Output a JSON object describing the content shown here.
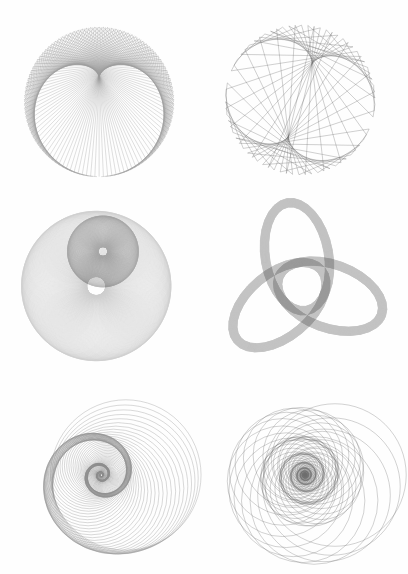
{
  "plate": {
    "title": "Envelope and Spiral Figures Plate",
    "background_color": "#fefefe",
    "width": 408,
    "height": 574,
    "ink_color": "#000000",
    "columns": 2,
    "rows": 3
  },
  "figures": [
    {
      "id": "cardioid-envelope",
      "name": "Cardioid Chord Envelope",
      "type": "chord-envelope",
      "description": "Heart-shaped cardioid formed as the envelope of chords joining point k to point 2k on a circle.",
      "center_x": 99,
      "center_y": 102,
      "radius": 78,
      "chord_count": 220,
      "multiplier": 2,
      "phase_deg": 90,
      "stroke_color": "#3a3a3a",
      "stroke_width": 0.34,
      "opacity": 0.5
    },
    {
      "id": "deltoid-envelope",
      "name": "Deltoid Chord Envelope",
      "type": "chord-envelope",
      "description": "Three-cusped deltoid formed as the envelope of chords joining point k to point 3k on a circle, drawn with sparse lines.",
      "center_x": 96,
      "center_y": 100,
      "radius": 78,
      "chord_count": 74,
      "multiplier": 3,
      "phase_deg": 18,
      "stroke_color": "#4a4a4a",
      "stroke_width": 0.32,
      "opacity": 0.85
    },
    {
      "id": "nested-limacon-rings",
      "name": "Nested Circle Envelopes",
      "type": "circle-family",
      "description": "Two concentric-offset families of circles producing a large pale ring and a smaller dark ring.",
      "rings": [
        {
          "name": "outer-ring",
          "center_x": 96,
          "center_y": 98,
          "path_radius": 34,
          "circle_radius": 44,
          "count": 230,
          "stroke_color": "#555555",
          "stroke_width": 0.3,
          "opacity": 0.28
        },
        {
          "name": "inner-ring",
          "center_x": 103,
          "center_y": 62,
          "path_radius": 16,
          "circle_radius": 21,
          "count": 180,
          "stroke_color": "#1c1c1c",
          "stroke_width": 0.3,
          "opacity": 0.3
        }
      ]
    },
    {
      "id": "trefoil-ellipse-rings",
      "name": "Trefoil Ellipse Rings",
      "type": "ellipse-family",
      "description": "Three interlocking elliptical ring envelopes arranged at 120 degree rotations forming a trefoil knot silhouette.",
      "center_x": 98,
      "center_y": 98,
      "ring_count": 3,
      "ring_offset": 31,
      "ellipse_rx": 57,
      "ellipse_ry": 33,
      "band_count": 150,
      "band_spread": 9,
      "rotations_deg": [
        20,
        140,
        260
      ],
      "stroke_color": "#3c3c3c",
      "stroke_width": 0.3,
      "opacity": 0.3
    },
    {
      "id": "logarithmic-spiral-circles",
      "name": "Spiral of Shrinking Circles",
      "type": "spiral-circles",
      "description": "Family of circles whose centres follow a logarithmic spiral while their radii shrink toward the eye.",
      "center_x": 101,
      "center_y": 96,
      "start_radius": 76,
      "decay": 0.9735,
      "angle_step_deg": 7.6,
      "center_offset_ratio": 0.33,
      "count": 150,
      "stroke_color": "#303030",
      "stroke_width": 0.34,
      "opacity": 0.55
    },
    {
      "id": "dense-spiral-circles",
      "name": "Dense Spiral Circle Rosette",
      "type": "spiral-circles",
      "description": "Tighter, higher-contrast family of spiralling circles forming a multi-armed rosette with a dark core.",
      "center_x": 101,
      "center_y": 96,
      "start_radius": 72,
      "decay": 0.9645,
      "angle_step_deg": 23.5,
      "center_offset_ratio": 0.42,
      "count": 165,
      "stroke_color": "#1a1a1a",
      "stroke_width": 0.32,
      "opacity": 0.62
    }
  ]
}
